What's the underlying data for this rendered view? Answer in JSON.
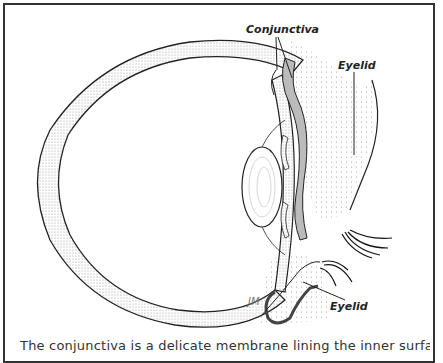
{
  "figure": {
    "labels": {
      "conjunctiva": "Conjunctiva",
      "eyelid_upper": "Eyelid",
      "eyelid_lower": "Eyelid",
      "signature": "JM"
    },
    "caption": "The conjunctiva is a delicate membrane lining the inner surface of the eyelids and"
  },
  "colors": {
    "stroke": "#222222",
    "stipple": "#bdbdbd",
    "frame": "#333333"
  }
}
